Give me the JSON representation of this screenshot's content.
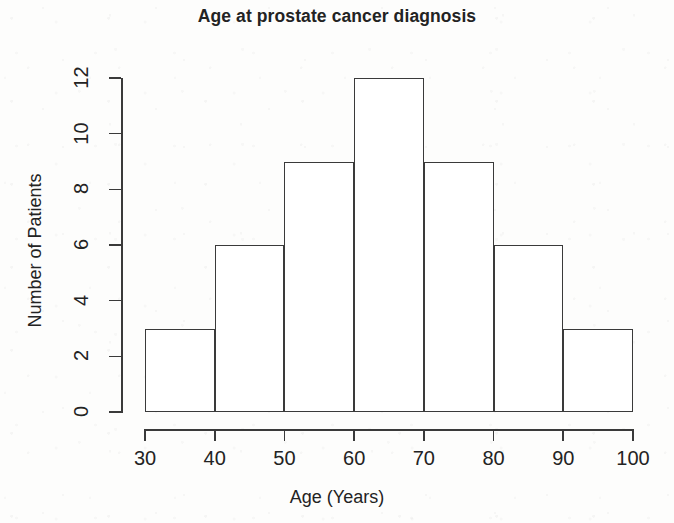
{
  "chart_data": {
    "type": "bar",
    "title": "Age at prostate cancer diagnosis",
    "xlabel": "Age (Years)",
    "ylabel": "Number of Patients",
    "categories": [
      "30-40",
      "40-50",
      "50-60",
      "60-70",
      "70-80",
      "80-90",
      "90-100"
    ],
    "bin_edges": [
      30,
      40,
      50,
      60,
      70,
      80,
      90,
      100
    ],
    "values": [
      3,
      6,
      9,
      12,
      9,
      6,
      3
    ],
    "xlim": [
      30,
      100
    ],
    "ylim": [
      0,
      12
    ],
    "x_ticks": [
      "30",
      "40",
      "50",
      "60",
      "70",
      "80",
      "90",
      "100"
    ],
    "x_tick_values": [
      30,
      40,
      50,
      60,
      70,
      80,
      90,
      100
    ],
    "y_ticks": [
      "0",
      "2",
      "4",
      "6",
      "8",
      "10",
      "12"
    ],
    "y_tick_values": [
      0,
      2,
      4,
      6,
      8,
      10,
      12
    ],
    "grid": false,
    "legend": false,
    "bar_fill_color": "#ffffff",
    "bar_border_color": "#3a3a3a",
    "background_color": "#fdfdfc",
    "text_color": "#232323"
  }
}
